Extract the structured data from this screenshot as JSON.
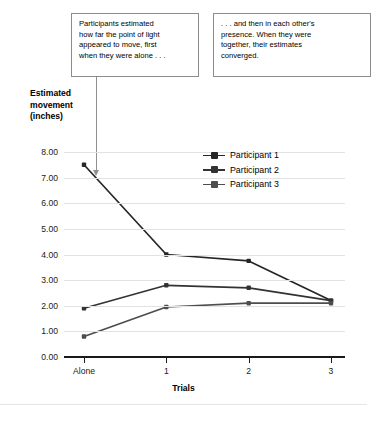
{
  "callouts": {
    "left": "Participants estimated\nhow far the point of light\nappeared to move, first\nwhen they were alone . . .",
    "right": ". . . and then in each other's\npresence. When they were\ntogether, their estimates\nconverged."
  },
  "axis": {
    "y_title": "Estimated\nmovement\n(inches)",
    "x_title": "Trials"
  },
  "legend": {
    "items": [
      {
        "label": "Participant 1",
        "color": "#262626"
      },
      {
        "label": "Participant 2",
        "color": "#333333"
      },
      {
        "label": "Participant 3",
        "color": "#4d4d4d"
      }
    ]
  },
  "chart_data": {
    "type": "line",
    "title": "",
    "xlabel": "Trials",
    "ylabel": "Estimated movement (inches)",
    "categories": [
      "Alone",
      "1",
      "2",
      "3"
    ],
    "ylim": [
      0.0,
      8.0
    ],
    "ytick_labels": [
      "0.00",
      "1.00",
      "2.00",
      "3.00",
      "4.00",
      "5.00",
      "6.00",
      "7.00",
      "8.00"
    ],
    "ytick_values": [
      0.0,
      1.0,
      2.0,
      3.0,
      4.0,
      5.0,
      6.0,
      7.0,
      8.0
    ],
    "grid": true,
    "legend_position": "inside-right-upper",
    "markers": "square",
    "series": [
      {
        "name": "Participant 1",
        "color": "#262626",
        "values": [
          7.5,
          4.0,
          3.75,
          2.2
        ]
      },
      {
        "name": "Participant 2",
        "color": "#333333",
        "values": [
          1.9,
          2.8,
          2.7,
          2.2
        ]
      },
      {
        "name": "Participant 3",
        "color": "#4d4d4d",
        "values": [
          0.8,
          1.95,
          2.1,
          2.1
        ]
      }
    ],
    "annotations": [
      {
        "text": "Participants estimated how far the point of light appeared to move, first when they were alone . . .",
        "points_to": "Participant 1 near Alone–1"
      },
      {
        "text": ". . . and then in each other's presence. When they were together, their estimates converged."
      }
    ]
  }
}
